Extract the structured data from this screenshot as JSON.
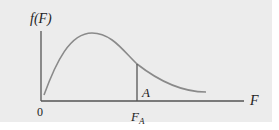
{
  "diagram": {
    "y_axis_label": "f(F)",
    "x_axis_label": "F",
    "origin_label": "0",
    "critical_value_label_main": "F",
    "critical_value_label_sub": "A",
    "area_label": "A",
    "colors": {
      "background": "#ececec",
      "axes": "#555555",
      "curve": "#8a8a8a",
      "text": "#222222"
    }
  }
}
